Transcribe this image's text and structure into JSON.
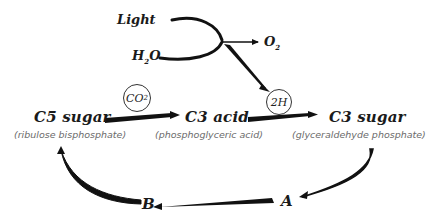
{
  "light_reactions": {
    "inputs": [
      "Light",
      "H2O"
    ],
    "outputs": [
      "O2"
    ],
    "light_label": "Light",
    "water_label": "H",
    "water_sub": "2",
    "water_tail": "O",
    "oxygen_label": "O",
    "oxygen_sub": "2"
  },
  "cycle": {
    "c5": {
      "name": "C5 sugar",
      "desc": "(ribulose bisphosphate)"
    },
    "c3acid": {
      "name": "C3 acid",
      "desc": "(phosphoglyceric acid)"
    },
    "c3sugar": {
      "name": "C3 sugar",
      "desc": "(glyceraldehyde phosphate)"
    },
    "co2_label": "CO",
    "co2_sub": "2",
    "h_label": "2H",
    "node_a": "A",
    "node_b": "B"
  },
  "colors": {
    "ink": "#111111",
    "subtext": "#6b6b6b",
    "background": "#ffffff"
  }
}
